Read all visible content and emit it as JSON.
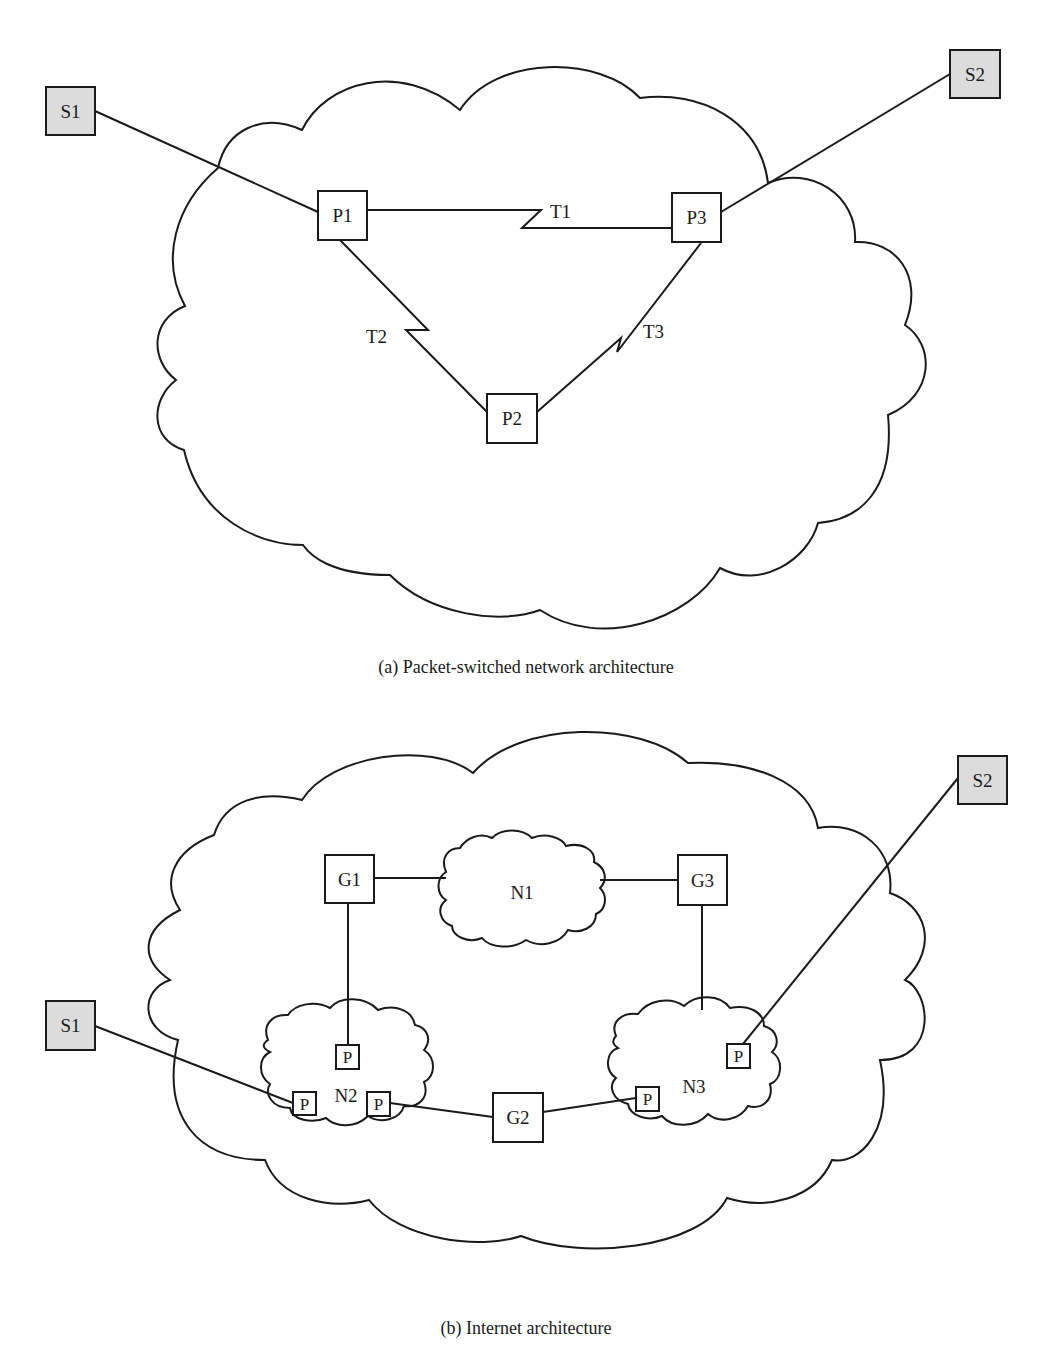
{
  "diagram_a": {
    "caption": "(a) Packet-switched network architecture",
    "stations": [
      {
        "id": "S1",
        "label": "S1"
      },
      {
        "id": "S2",
        "label": "S2"
      }
    ],
    "nodes": [
      {
        "id": "P1",
        "label": "P1"
      },
      {
        "id": "P2",
        "label": "P2"
      },
      {
        "id": "P3",
        "label": "P3"
      }
    ],
    "links": [
      {
        "id": "T1",
        "label": "T1",
        "from": "P1",
        "to": "P3"
      },
      {
        "id": "T2",
        "label": "T2",
        "from": "P1",
        "to": "P2"
      },
      {
        "id": "T3",
        "label": "T3",
        "from": "P2",
        "to": "P3"
      }
    ],
    "access_links": [
      {
        "from": "S1",
        "to": "P1"
      },
      {
        "from": "S2",
        "to": "P3"
      }
    ]
  },
  "diagram_b": {
    "caption": "(b) Internet architecture",
    "stations": [
      {
        "id": "S1",
        "label": "S1"
      },
      {
        "id": "S2",
        "label": "S2"
      }
    ],
    "gateways": [
      {
        "id": "G1",
        "label": "G1"
      },
      {
        "id": "G2",
        "label": "G2"
      },
      {
        "id": "G3",
        "label": "G3"
      }
    ],
    "networks": [
      {
        "id": "N1",
        "label": "N1"
      },
      {
        "id": "N2",
        "label": "N2"
      },
      {
        "id": "N3",
        "label": "N3"
      }
    ],
    "packet_node_label": "P",
    "links": [
      {
        "from": "G1",
        "to": "N1"
      },
      {
        "from": "N1",
        "to": "G3"
      },
      {
        "from": "G1",
        "to": "N2.P"
      },
      {
        "from": "G3",
        "to": "N3"
      },
      {
        "from": "S1",
        "to": "N2.P"
      },
      {
        "from": "N2.P",
        "to": "G2"
      },
      {
        "from": "G2",
        "to": "N3.P"
      },
      {
        "from": "S2",
        "to": "N3.P"
      }
    ]
  }
}
